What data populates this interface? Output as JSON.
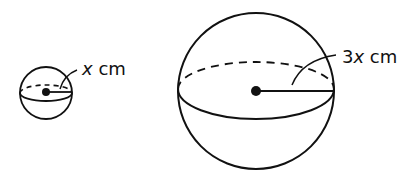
{
  "diagram": {
    "type": "two-spheres",
    "small_sphere": {
      "radius_label_var": "x",
      "radius_label_unit": " cm"
    },
    "large_sphere": {
      "radius_label_coef": "3",
      "radius_label_var": "x",
      "radius_label_unit": " cm"
    },
    "colors": {
      "stroke": "#111111",
      "background": "#ffffff"
    }
  }
}
